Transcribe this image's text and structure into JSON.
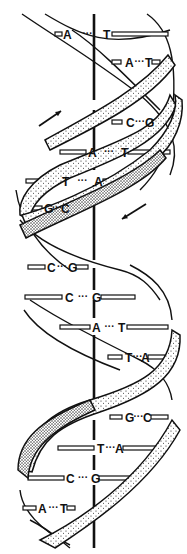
{
  "diagram": {
    "colors": {
      "ink": "#111111",
      "background": "#ffffff",
      "stipple": "#222222"
    },
    "axis": {
      "x": 94,
      "y_top": 10,
      "y_bottom": 548
    },
    "base_pairs": [
      {
        "left": "A",
        "right": "T",
        "y": 34,
        "lx": 63,
        "rx": 103,
        "bar_left": [
          55,
          62
        ],
        "bar_right": [
          112,
          168
        ]
      },
      {
        "left": "A",
        "right": "T",
        "y": 62,
        "lx": 125,
        "rx": 145,
        "bar_left": [
          112,
          121
        ],
        "bar_right": [
          152,
          160
        ]
      },
      {
        "left": "C",
        "right": "G",
        "y": 122,
        "lx": 126,
        "rx": 145,
        "bar_left": [
          112,
          122
        ],
        "bar_right": [
          152,
          166
        ]
      },
      {
        "left": "A",
        "right": "T",
        "y": 152,
        "lx": 88,
        "rx": 121,
        "bar_left": [
          60,
          86
        ],
        "bar_right": [
          128,
          170
        ]
      },
      {
        "left": "T",
        "right": "A",
        "y": 181,
        "lx": 62,
        "rx": 94,
        "bar_left": [
          26,
          60
        ],
        "bar_right": [
          103,
          125
        ]
      },
      {
        "left": "G",
        "right": "C",
        "y": 208,
        "lx": 44,
        "rx": 61,
        "bar_left": [
          28,
          42
        ],
        "bar_right": [
          68,
          78
        ]
      },
      {
        "left": "C",
        "right": "G",
        "y": 267,
        "lx": 47,
        "rx": 68,
        "bar_left": [
          28,
          45
        ],
        "bar_right": [
          76,
          88
        ]
      },
      {
        "left": "C",
        "right": "G",
        "y": 297,
        "lx": 65,
        "rx": 92,
        "bar_left": [
          25,
          62
        ],
        "bar_right": [
          101,
          135
        ]
      },
      {
        "left": "A",
        "right": "T",
        "y": 327,
        "lx": 92,
        "rx": 118,
        "bar_left": [
          60,
          90
        ],
        "bar_right": [
          127,
          168
        ]
      },
      {
        "left": "T",
        "right": "A",
        "y": 357,
        "lx": 125,
        "rx": 141,
        "bar_left": [
          108,
          122
        ],
        "bar_right": [
          148,
          165
        ]
      },
      {
        "left": "G",
        "right": "C",
        "y": 417,
        "lx": 125,
        "rx": 143,
        "bar_left": [
          110,
          122
        ],
        "bar_right": [
          151,
          168
        ]
      },
      {
        "left": "T",
        "right": "A",
        "y": 448,
        "lx": 97,
        "rx": 115,
        "bar_left": [
          58,
          94
        ],
        "bar_right": [
          123,
          160
        ]
      },
      {
        "left": "C",
        "right": "G",
        "y": 478,
        "lx": 66,
        "rx": 91,
        "bar_left": [
          28,
          64
        ],
        "bar_right": [
          99,
          130
        ]
      },
      {
        "left": "A",
        "right": "T",
        "y": 508,
        "lx": 38,
        "rx": 60,
        "bar_left": [
          23,
          36
        ],
        "bar_right": [
          67,
          75
        ]
      }
    ],
    "dots_text": "···",
    "arrows": [
      {
        "name": "arrow-up-right",
        "from": [
          39,
          126
        ],
        "to": [
          61,
          111
        ]
      },
      {
        "name": "arrow-down-left",
        "from": [
          146,
          204
        ],
        "to": [
          122,
          219
        ]
      }
    ]
  }
}
